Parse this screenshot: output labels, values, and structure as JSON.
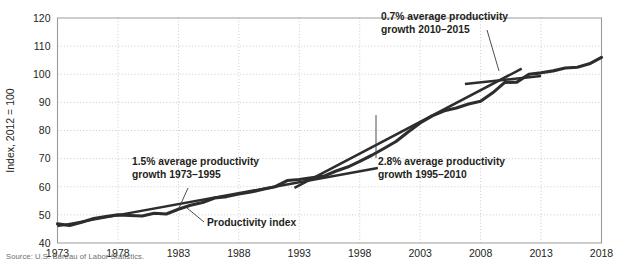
{
  "chart_data": {
    "type": "line",
    "title": "",
    "subtitle": "",
    "xlabel": "",
    "ylabel": "Index, 2012 = 100",
    "xlim": [
      1973,
      2018
    ],
    "ylim": [
      40,
      120
    ],
    "grid": true,
    "legend_position": "none",
    "x_ticks": [
      "1973",
      "1978",
      "1983",
      "1988",
      "1993",
      "1998",
      "2003",
      "2008",
      "2013",
      "2018"
    ],
    "y_ticks": [
      "40",
      "50",
      "60",
      "70",
      "80",
      "90",
      "100",
      "110",
      "120"
    ],
    "series": [
      {
        "name": "Productivity index",
        "x": [
          1973,
          1974,
          1975,
          1976,
          1977,
          1978,
          1979,
          1980,
          1981,
          1982,
          1983,
          1984,
          1985,
          1986,
          1987,
          1988,
          1989,
          1990,
          1991,
          1992,
          1993,
          1994,
          1995,
          1996,
          1997,
          1998,
          1999,
          2000,
          2001,
          2002,
          2003,
          2004,
          2005,
          2006,
          2007,
          2008,
          2009,
          2010,
          2011,
          2012,
          2013,
          2014,
          2015,
          2016,
          2017,
          2018
        ],
        "values": [
          46.8,
          46.2,
          47.4,
          48.7,
          49.4,
          50.0,
          49.8,
          49.6,
          50.6,
          50.3,
          52.0,
          53.4,
          54.4,
          56.0,
          56.5,
          57.4,
          58.1,
          59.1,
          60.0,
          62.2,
          62.6,
          63.2,
          63.7,
          65.5,
          67.0,
          69.0,
          71.2,
          73.6,
          76.1,
          79.5,
          82.7,
          85.2,
          87.0,
          88.0,
          89.4,
          90.4,
          93.4,
          97.1,
          97.2,
          100.0,
          100.5,
          101.2,
          102.2,
          102.5,
          103.7,
          106.0
        ]
      }
    ],
    "trend_lines": [
      {
        "name": "trend-1973-1995",
        "label": "1.5% average productivity growth 1973–1995",
        "rate_pct": 1.5,
        "period": "1973–1995",
        "x_start": 1973,
        "x_end": 1999.5,
        "y_start": 46.0,
        "y_end": 66.7
      },
      {
        "name": "trend-1995-2010",
        "label": "2.8% average productivity growth 1995–2010",
        "rate_pct": 2.8,
        "period": "1995–2010",
        "x_start": 1992.6,
        "x_end": 2011.4,
        "y_start": 59.6,
        "y_end": 102.0
      },
      {
        "name": "trend-2010-2015",
        "label": "0.7% average productivity growth 2010–2015",
        "rate_pct": 0.7,
        "period": "2010–2015",
        "x_start": 2006.7,
        "x_end": 2013.0,
        "y_start": 96.5,
        "y_end": 99.4
      }
    ],
    "annotations": [
      {
        "name": "annotation-0-7",
        "line1": "0.7% average productivity",
        "line2": "growth 2010–2015",
        "text_x": 381,
        "text_y": 20,
        "leader": "M 487 30 L 499 71"
      },
      {
        "name": "annotation-1-5",
        "line1": "1.5% average productivity",
        "line2": "growth 1973–1995",
        "text_x": 132,
        "text_y": 165,
        "leader": "M 188 188 L 179 208"
      },
      {
        "name": "annotation-2-8",
        "line1": "2.8% average productivity",
        "line2": "growth 1995–2010",
        "text_x": 378,
        "text_y": 165,
        "leader": "M 376 158 L 376 115"
      },
      {
        "name": "annotation-productivity-index",
        "line1": "Productivity index",
        "line2": "",
        "text_x": 207,
        "text_y": 226,
        "leader": "M 204 222 L 187 208"
      }
    ]
  },
  "source": {
    "note": "Source: U.S. Bureau of Labor Statistics."
  },
  "colors": {
    "line": "#2d2d2d",
    "grid": "#c9c9c9",
    "axis": "#9b9b9b",
    "text": "#231f20",
    "source_text": "#6d6d6d",
    "background": "#ffffff"
  }
}
